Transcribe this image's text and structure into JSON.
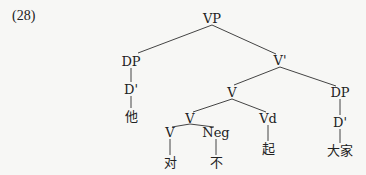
{
  "example_number": "(28)",
  "nodes": {
    "vp": {
      "label": "VP",
      "x": 212,
      "y": 18
    },
    "dp_left": {
      "label": "DP",
      "x": 131,
      "y": 61
    },
    "dbar_left": {
      "label": "D'",
      "x": 131,
      "y": 89
    },
    "ta": {
      "label": "他",
      "x": 131,
      "y": 116
    },
    "vbar": {
      "label": "V'",
      "x": 280,
      "y": 60
    },
    "v_mid": {
      "label": "V",
      "x": 232,
      "y": 92
    },
    "dp_right": {
      "label": "DP",
      "x": 340,
      "y": 92
    },
    "v_low": {
      "label": "V",
      "x": 190,
      "y": 118
    },
    "vd": {
      "label": "Vd",
      "x": 268,
      "y": 118
    },
    "dbar_right": {
      "label": "D'",
      "x": 340,
      "y": 122
    },
    "v_leaf": {
      "label": "V",
      "x": 170,
      "y": 132
    },
    "neg": {
      "label": "Neg",
      "x": 216,
      "y": 132
    },
    "dui": {
      "label": "对",
      "x": 170,
      "y": 162
    },
    "bu": {
      "label": "不",
      "x": 216,
      "y": 162
    },
    "qi": {
      "label": "起",
      "x": 268,
      "y": 148
    },
    "dajia": {
      "label": "大家",
      "x": 340,
      "y": 150
    }
  }
}
